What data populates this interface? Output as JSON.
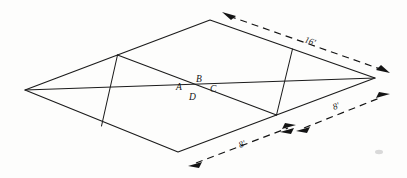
{
  "diagram": {
    "type": "perspective-floor-plan",
    "stroke_color": "#1b1b1b",
    "background_color": "#fdfdfc",
    "point_labels": [
      {
        "id": "A",
        "text": "A",
        "x": 176,
        "y": 90
      },
      {
        "id": "B",
        "text": "B",
        "x": 196,
        "y": 82
      },
      {
        "id": "C",
        "text": "C",
        "x": 210,
        "y": 92
      },
      {
        "id": "D",
        "text": "D",
        "x": 189,
        "y": 100
      }
    ],
    "dimensions": [
      {
        "id": "top-right-16ft",
        "text": "16'",
        "x": 304,
        "y": 42
      },
      {
        "id": "right-8ft",
        "text": "8'",
        "x": 334,
        "y": 110
      },
      {
        "id": "bottom-8ft",
        "text": "8'",
        "x": 240,
        "y": 148
      }
    ],
    "vertices": {
      "left": {
        "x": 25,
        "y": 90
      },
      "top": {
        "x": 210,
        "y": 20
      },
      "right": {
        "x": 375,
        "y": 78
      },
      "bottom": {
        "x": 178,
        "y": 152
      }
    }
  }
}
